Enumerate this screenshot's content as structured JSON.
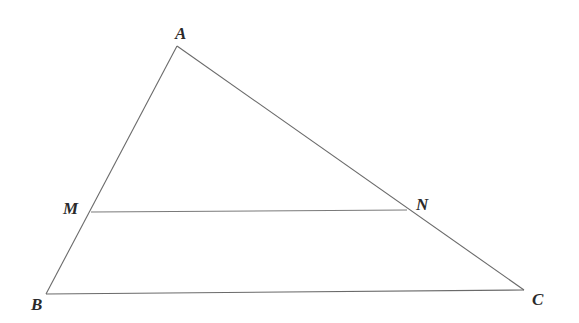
{
  "diagram": {
    "type": "geometry-triangle",
    "colors": {
      "line": "#6a6a6a",
      "label": "#2a2a2a",
      "background": "#ffffff"
    },
    "points": [
      {
        "id": "A",
        "label": "A"
      },
      {
        "id": "B",
        "label": "B"
      },
      {
        "id": "C",
        "label": "C"
      },
      {
        "id": "M",
        "label": "M",
        "on": "AB"
      },
      {
        "id": "N",
        "label": "N",
        "on": "AC"
      }
    ],
    "segments": [
      {
        "id": "AB",
        "from": "A",
        "to": "B"
      },
      {
        "id": "BC",
        "from": "B",
        "to": "C"
      },
      {
        "id": "CA",
        "from": "C",
        "to": "A"
      },
      {
        "id": "MN",
        "from": "M",
        "to": "N"
      }
    ]
  }
}
